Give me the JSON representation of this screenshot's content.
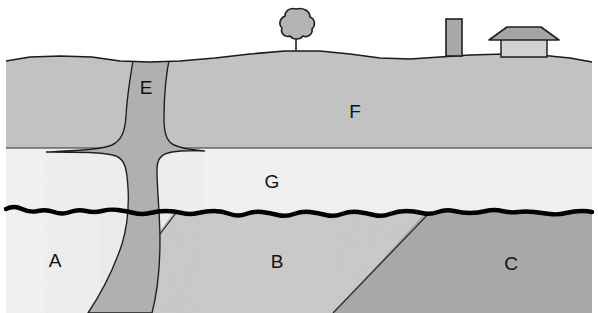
{
  "figure": {
    "kind": "geologic-cross-section",
    "title_fragment": "",
    "background_color": "#ffffff",
    "width": 598,
    "height": 313
  },
  "palette": {
    "outline": "#1a1a1a",
    "unconformity": "#000000",
    "unit_a_fill": "#efefef",
    "unit_b_fill": "#c9c9c9",
    "unit_c_fill": "#a8a8a8",
    "unit_e_fill": "#b0b0b0",
    "unit_f_fill": "#c2c2c2",
    "unit_g_fill": "#f0f0f0",
    "tree_fill": "#b4b4b4",
    "tower_fill": "#a9a9a9",
    "house_wall_fill": "#d2d2d2",
    "house_roof_fill": "#a5a5a5",
    "label_color": "#111111"
  },
  "units": [
    {
      "id": "A",
      "label": "A",
      "name": "basement-unit-a",
      "description": "lightest basement block, lower left, below unconformity",
      "label_x": 55,
      "label_y": 262,
      "fill": "#efefef"
    },
    {
      "id": "B",
      "label": "B",
      "name": "basement-unit-b",
      "description": "medium-light tilted basement block, lower centre",
      "label_x": 277,
      "label_y": 263,
      "fill": "#c9c9c9"
    },
    {
      "id": "C",
      "label": "C",
      "name": "basement-unit-c",
      "description": "darkest tilted basement block, lower right",
      "label_x": 511,
      "label_y": 265,
      "fill": "#a8a8a8"
    },
    {
      "id": "E",
      "label": "E",
      "name": "igneous-dike-e",
      "description": "vertical dike cutting all units, flares into a sill at the F/G contact",
      "label_x": 146,
      "label_y": 89,
      "fill": "#b0b0b0"
    },
    {
      "id": "F",
      "label": "F",
      "name": "sedimentary-layer-f",
      "description": "uppermost medium-grey layer forming the land surface",
      "label_x": 355,
      "label_y": 113,
      "fill": "#c2c2c2"
    },
    {
      "id": "G",
      "label": "G",
      "name": "sedimentary-layer-g",
      "description": "pale layer between F and the wavy unconformity",
      "label_x": 272,
      "label_y": 183,
      "fill": "#f0f0f0"
    }
  ],
  "contacts": [
    {
      "name": "ground-surface",
      "type": "topographic-surface",
      "description": "gently undulating land surface at the top of unit F"
    },
    {
      "name": "f-g-contact",
      "type": "conformable-bedding-plane",
      "description": "flat horizontal contact between layers F and G at y = 148"
    },
    {
      "name": "unconformity",
      "type": "angular-unconformity",
      "description": "thick black wavy erosional surface at y = 212 separating tilted blocks A/B/C below from flat-lying G and F above"
    },
    {
      "name": "a-b-fault-contact",
      "type": "tilted-block-contact",
      "description": "diagonal contact between basement blocks A and B"
    },
    {
      "name": "b-c-fault-contact",
      "type": "tilted-block-contact",
      "description": "diagonal contact between basement blocks B and C"
    }
  ],
  "surface_features": [
    {
      "name": "tree",
      "label": "tree",
      "x": 296,
      "base_y": 52,
      "description": "small cloud-crowned tree on the crest of the land surface"
    },
    {
      "name": "tower",
      "label": "tower",
      "x": 454,
      "base_y": 56,
      "description": "narrow tall rectangular tower or silo"
    },
    {
      "name": "house",
      "label": "house",
      "x": 524,
      "base_y": 57,
      "description": "small building with a wide overhanging gable roof"
    }
  ],
  "label_texts": {
    "a": "A",
    "b": "B",
    "c": "C",
    "e": "E",
    "f": "F",
    "g": "G"
  }
}
